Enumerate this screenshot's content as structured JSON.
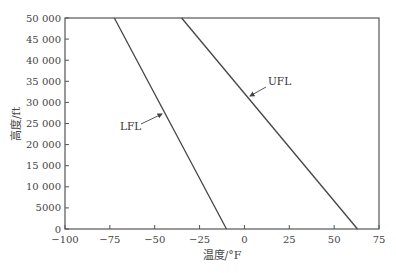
{
  "chart_data": {
    "type": "line",
    "title": "",
    "xlabel": "温度/°F",
    "ylabel": "高度/ft",
    "xlim": [
      -100,
      75
    ],
    "ylim": [
      0,
      50000
    ],
    "xticks": [
      -100,
      -75,
      -50,
      -25,
      0,
      25,
      50,
      75
    ],
    "xtick_labels": [
      "−100",
      "−75",
      "−50",
      "−25",
      "0",
      "25",
      "50",
      "75"
    ],
    "yticks": [
      0,
      5000,
      10000,
      15000,
      20000,
      25000,
      30000,
      35000,
      40000,
      45000,
      50000
    ],
    "ytick_labels": [
      "0",
      "5000",
      "10 000",
      "15 000",
      "20 000",
      "25 000",
      "30 000",
      "35 000",
      "40 000",
      "45 000",
      "50 000"
    ],
    "grid": false,
    "legend": "none (inline annotations)",
    "series": [
      {
        "name": "LFL",
        "x": [
          -10,
          -72.5
        ],
        "y": [
          0,
          50000
        ]
      },
      {
        "name": "UFL",
        "x": [
          63,
          -35
        ],
        "y": [
          0,
          50000
        ]
      }
    ],
    "annotations": [
      {
        "text": "LFL",
        "points_to_series": "LFL"
      },
      {
        "text": "UFL",
        "points_to_series": "UFL"
      }
    ],
    "colors": {
      "line": "#444444",
      "axis": "#555555",
      "background": "#ffffff"
    }
  }
}
